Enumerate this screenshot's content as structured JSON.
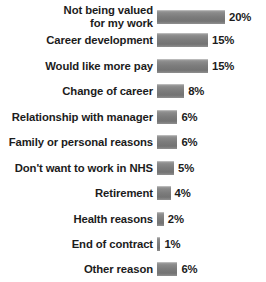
{
  "chart_data": {
    "type": "bar",
    "orientation": "horizontal",
    "title": "",
    "subtitle": "",
    "xlabel": "",
    "ylabel": "",
    "grid": false,
    "legend": null,
    "xlim": [
      0,
      20
    ],
    "value_suffix": "%",
    "categories": [
      "Not being valued\nfor my work",
      "Career development",
      "Would like more pay",
      "Change of career",
      "Relationship with manager",
      "Family or personal reasons",
      "Don't want to work in NHS",
      "Retirement",
      "Health reasons",
      "End of contract",
      "Other reason"
    ],
    "values": [
      20,
      15,
      15,
      8,
      6,
      6,
      5,
      4,
      2,
      1,
      6
    ],
    "value_labels": [
      "20%",
      "15%",
      "15%",
      "8%",
      "6%",
      "6%",
      "5%",
      "4%",
      "2%",
      "1%",
      "6%"
    ],
    "bars": [
      {
        "label": "Not being valued\nfor my work",
        "value": 20,
        "value_label": "20%",
        "top": 7,
        "height": 20
      },
      {
        "label": "Career development",
        "value": 15,
        "value_label": "15%",
        "top": 32,
        "height": 16
      },
      {
        "label": "Would like more pay",
        "value": 15,
        "value_label": "15%",
        "top": 58,
        "height": 16
      },
      {
        "label": "Change of career",
        "value": 8,
        "value_label": "8%",
        "top": 83,
        "height": 16
      },
      {
        "label": "Relationship with manager",
        "value": 6,
        "value_label": "6%",
        "top": 109,
        "height": 16
      },
      {
        "label": "Family or personal reasons",
        "value": 6,
        "value_label": "6%",
        "top": 134,
        "height": 16
      },
      {
        "label": "Don't want to work in NHS",
        "value": 5,
        "value_label": "5%",
        "top": 160,
        "height": 16
      },
      {
        "label": "Retirement",
        "value": 4,
        "value_label": "4%",
        "top": 185,
        "height": 16
      },
      {
        "label": "Health reasons",
        "value": 2,
        "value_label": "2%",
        "top": 211,
        "height": 16
      },
      {
        "label": "End of contract",
        "value": 1,
        "value_label": "1%",
        "top": 236,
        "height": 16
      },
      {
        "label": "Other reason",
        "value": 6,
        "value_label": "6%",
        "top": 261,
        "height": 16
      }
    ]
  },
  "style": {
    "bar_color": "#7b7b7b",
    "bar_highlight": "#9d9d9d",
    "text_color": "#1c1c1c",
    "background": "#ffffff",
    "px_per_unit": 3.4,
    "bar_origin_x": 160
  }
}
